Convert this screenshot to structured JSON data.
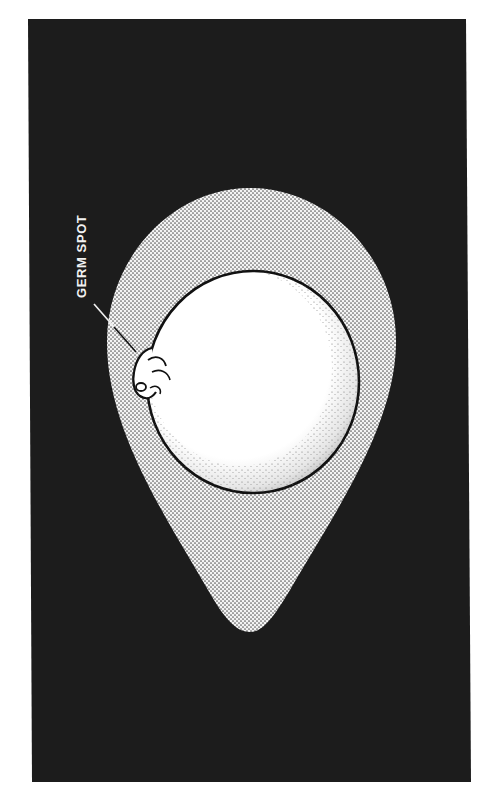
{
  "figure": {
    "callouts": [
      {
        "label": "GERM SPOT",
        "rotation_deg": -90
      }
    ]
  },
  "colors": {
    "background": "#ffffff",
    "panel": "#1c1c1c",
    "albumen": "#d9d9d9",
    "albumen_dots": "#6a6a6a",
    "yolk": "#ffffff",
    "outline": "#111111",
    "label_text": "#f2f2f2"
  }
}
